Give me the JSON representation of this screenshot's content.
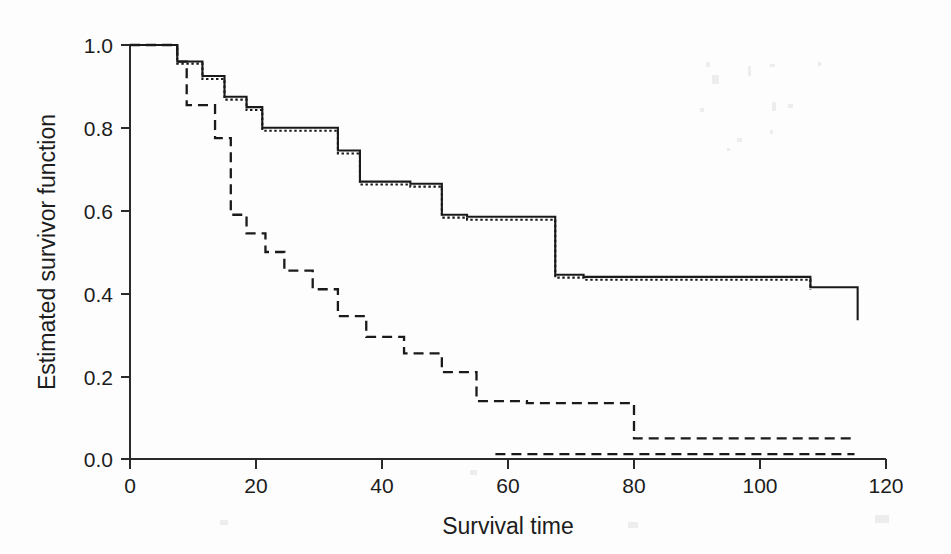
{
  "figure": {
    "background_color": "#fdfdfd",
    "ink_color": "#1a1a1a"
  },
  "chart_data": {
    "type": "line",
    "title": "",
    "subtitle": "",
    "xlabel": "Survival time",
    "ylabel": "Estimated survivor function",
    "xlim": [
      0,
      120
    ],
    "ylim": [
      0.0,
      1.0
    ],
    "xticks": [
      0,
      20,
      40,
      60,
      80,
      100,
      120
    ],
    "xtick_labels": [
      "0",
      "20",
      "40",
      "60",
      "80",
      "100",
      "120"
    ],
    "yticks": [
      0.0,
      0.2,
      0.4,
      0.6,
      0.8,
      1.0
    ],
    "ytick_labels": [
      "0.0",
      "0.2",
      "0.4",
      "0.6",
      "0.8",
      "1.0"
    ],
    "grid": false,
    "legend_position": "none",
    "legend": [],
    "annotations": [],
    "step_interpolation": "post",
    "series": [
      {
        "name": "solid-survivor-curve",
        "style": "solid",
        "x": [
          0,
          5.5,
          7.5,
          9.5,
          11.5,
          13.5,
          15.0,
          17.0,
          18.5,
          20.5,
          21.0,
          26.0,
          33.0,
          35.0,
          36.5,
          38.5,
          44.5,
          47.5,
          49.5,
          52.0,
          53.5,
          60.5,
          67.5,
          69.0,
          72.0,
          84.0,
          108.0,
          115.0,
          115.5
        ],
        "y": [
          1.0,
          1.0,
          0.96,
          0.96,
          0.925,
          0.925,
          0.875,
          0.875,
          0.85,
          0.85,
          0.8,
          0.8,
          0.745,
          0.745,
          0.67,
          0.67,
          0.665,
          0.665,
          0.59,
          0.59,
          0.585,
          0.585,
          0.445,
          0.445,
          0.44,
          0.44,
          0.415,
          0.415,
          0.335
        ]
      },
      {
        "name": "dotted-survivor-curve",
        "style": "dotted",
        "x": [
          0,
          5.5,
          7.5,
          9.5,
          11.5,
          13.5,
          15.0,
          17.0,
          18.5,
          20.5,
          21.0,
          26.0,
          33.0,
          35.0,
          36.5,
          38.5,
          44.5,
          47.5,
          49.5,
          52.0,
          53.5,
          60.5,
          67.5,
          69.0,
          72.0,
          84.0,
          108.0
        ],
        "y": [
          1.0,
          1.0,
          0.955,
          0.955,
          0.918,
          0.918,
          0.868,
          0.868,
          0.843,
          0.843,
          0.793,
          0.793,
          0.738,
          0.738,
          0.663,
          0.663,
          0.658,
          0.658,
          0.583,
          0.583,
          0.578,
          0.578,
          0.438,
          0.438,
          0.433,
          0.433,
          0.408
        ]
      },
      {
        "name": "dashed-survivor-curve",
        "style": "dashed",
        "x": [
          0,
          6.0,
          7.5,
          8.5,
          9.0,
          12.0,
          13.5,
          15.0,
          16.0,
          17.5,
          18.5,
          20.0,
          21.5,
          23.0,
          24.5,
          26.0,
          29.0,
          31.0,
          33.0,
          35.5,
          37.5,
          40.0,
          43.5,
          47.0,
          49.5,
          52.0,
          55.0,
          58.0,
          63.0,
          70.0,
          80.0,
          95.0,
          115.0
        ],
        "y": [
          1.0,
          1.0,
          0.96,
          0.96,
          0.855,
          0.855,
          0.775,
          0.775,
          0.59,
          0.59,
          0.545,
          0.545,
          0.5,
          0.5,
          0.455,
          0.455,
          0.41,
          0.41,
          0.345,
          0.345,
          0.295,
          0.295,
          0.255,
          0.255,
          0.21,
          0.21,
          0.14,
          0.14,
          0.135,
          0.135,
          0.05,
          0.05,
          0.045
        ]
      }
    ],
    "dashed_tail": {
      "name": "dashed-baseline-tail",
      "x": [
        58.0,
        115.0
      ],
      "y": [
        0.012,
        0.012
      ]
    }
  }
}
